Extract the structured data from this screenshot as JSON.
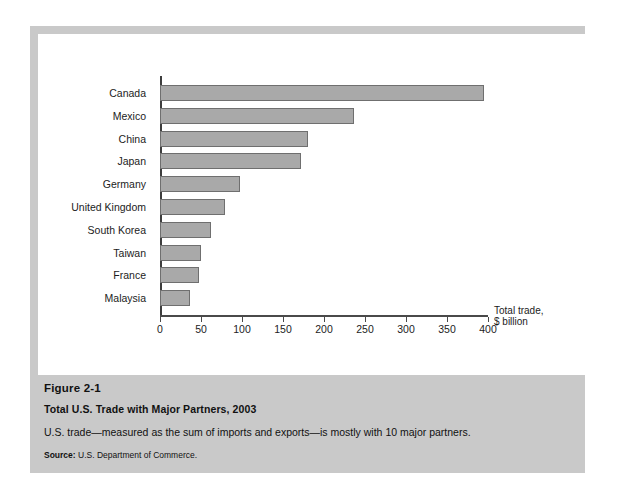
{
  "chart_data": {
    "type": "bar",
    "orientation": "horizontal",
    "title": "Total U.S. Trade with Major Partners, 2003",
    "xlabel": "Total trade, $ billion",
    "ylabel": "",
    "xlim": [
      0,
      400
    ],
    "xticks": [
      0,
      50,
      100,
      150,
      200,
      250,
      300,
      350,
      400
    ],
    "grid": false,
    "legend": false,
    "categories": [
      "Canada",
      "Mexico",
      "China",
      "Japan",
      "Germany",
      "United Kingdom",
      "South Korea",
      "Taiwan",
      "France",
      "Malaysia"
    ],
    "values": [
      395,
      236,
      180,
      172,
      98,
      79,
      62,
      50,
      47,
      37
    ]
  },
  "axis": {
    "caption_line1": "Total trade,",
    "caption_line2": "$ billion"
  },
  "caption": {
    "figure_number": "Figure 2-1",
    "title": "Total U.S. Trade with Major Partners, 2003",
    "description": "U.S. trade—measured as the sum of imports and exports—is mostly with 10 major partners.",
    "source_label": "Source:",
    "source_text": "U.S. Department of Commerce."
  },
  "colors": {
    "bar_fill": "#a9a9a9",
    "bar_border": "#6f6f6f",
    "panel_background": "#c9c9c9",
    "plot_background": "#ffffff",
    "axis": "#4a4a4a"
  }
}
